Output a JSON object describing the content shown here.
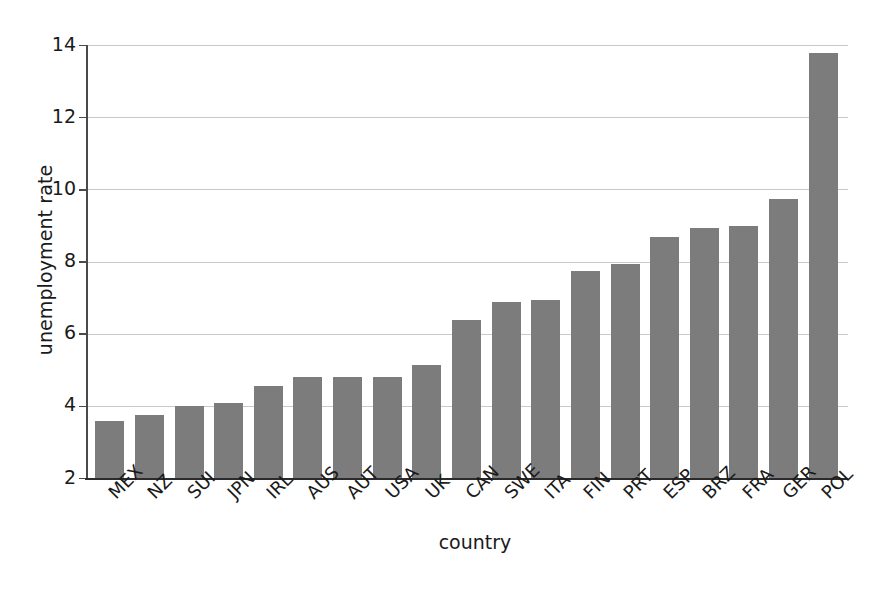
{
  "chart_data": {
    "type": "bar",
    "title": "",
    "subtitle": "",
    "xlabel": "country",
    "ylabel": "unemployment rate",
    "categories": [
      "MEX",
      "NZ",
      "SUI",
      "JPN",
      "IRL",
      "AUS",
      "AUT",
      "USA",
      "UK",
      "CAN",
      "SWE",
      "ITA",
      "FIN",
      "PRT",
      "ESP",
      "BRZ",
      "FRA",
      "GER",
      "POL"
    ],
    "values": [
      3.6,
      3.75,
      4.0,
      4.1,
      4.55,
      4.8,
      4.8,
      4.8,
      5.15,
      6.4,
      6.9,
      6.95,
      7.75,
      7.95,
      8.7,
      8.95,
      9.0,
      9.75,
      13.8
    ],
    "ylim": [
      2,
      14
    ],
    "ytick_labels": [
      "14",
      "12",
      "10",
      "8",
      "6",
      "4",
      "2"
    ],
    "ytick_values": [
      14,
      12,
      10,
      8,
      6,
      4,
      2
    ],
    "grid": true,
    "grid_axis": "y",
    "legend": false,
    "legend_position": "none",
    "bar_color": "#7c7c7c",
    "grid_color": "#c9c9c9",
    "axis_color": "#2b2b2b",
    "background_color": "#ffffff",
    "xtick_label_rotation": -45
  }
}
